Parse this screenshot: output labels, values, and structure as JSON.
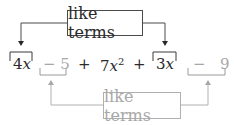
{
  "diagram": {
    "top_label": "like terms",
    "bottom_label": "like terms",
    "terms": [
      {
        "id": "t1",
        "coef": "4",
        "var": "x",
        "group": "dark",
        "bracket": "top"
      },
      {
        "id": "t2",
        "sign": "−",
        "value": "5",
        "group": "light",
        "bracket": "bottom"
      },
      {
        "id": "op1",
        "text": "+"
      },
      {
        "id": "t3",
        "coef": "7",
        "var": "x",
        "exp": "2"
      },
      {
        "id": "op2",
        "text": "+"
      },
      {
        "id": "t4",
        "coef": "3",
        "var": "x",
        "group": "dark",
        "bracket": "top"
      },
      {
        "id": "t5",
        "sign": "−",
        "value": "9",
        "group": "light",
        "bracket": "bottom"
      }
    ],
    "colors": {
      "dark": "#2a2a2a",
      "light": "#a8a8a8"
    }
  }
}
